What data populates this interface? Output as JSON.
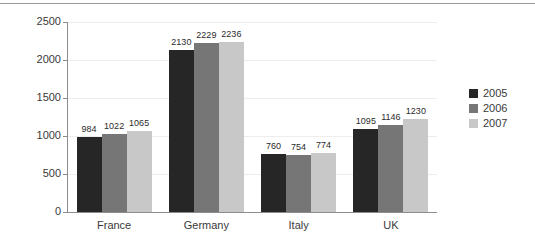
{
  "chart_data": {
    "type": "bar",
    "title": "",
    "subtitle": "",
    "xlabel": "",
    "ylabel": "",
    "categories": [
      "France",
      "Germany",
      "Italy",
      "UK"
    ],
    "series": [
      {
        "name": "2005",
        "color": "#262626",
        "values": [
          984,
          2130,
          760,
          1095
        ]
      },
      {
        "name": "2006",
        "color": "#767676",
        "values": [
          1022,
          2229,
          754,
          1146
        ]
      },
      {
        "name": "2007",
        "color": "#c8c8c8",
        "values": [
          1065,
          2236,
          774,
          1230
        ]
      }
    ],
    "ylim": [
      0,
      2500
    ],
    "yticks": [
      0,
      500,
      1000,
      1500,
      2000,
      2500
    ],
    "ytick_labels": [
      "0",
      "500",
      "1000",
      "1500",
      "2000",
      "2500"
    ],
    "grid": true,
    "grid_axis": "y",
    "legend_position": "right",
    "data_labels": true,
    "data_labels_values": [
      [
        "984",
        "1022",
        "1065"
      ],
      [
        "2130",
        "2229",
        "2236"
      ],
      [
        "760",
        "754",
        "774"
      ],
      [
        "1095",
        "1146",
        "1230"
      ]
    ],
    "background": "#ffffff",
    "axis_color": "#8d8d8d",
    "gridline_color": "#ededed"
  },
  "legend": {
    "entries": [
      {
        "label": "2005",
        "color": "#262626"
      },
      {
        "label": "2006",
        "color": "#767676"
      },
      {
        "label": "2007",
        "color": "#c8c8c8"
      }
    ]
  },
  "decorations": {
    "top_rule_color": "#9a9a9a"
  }
}
